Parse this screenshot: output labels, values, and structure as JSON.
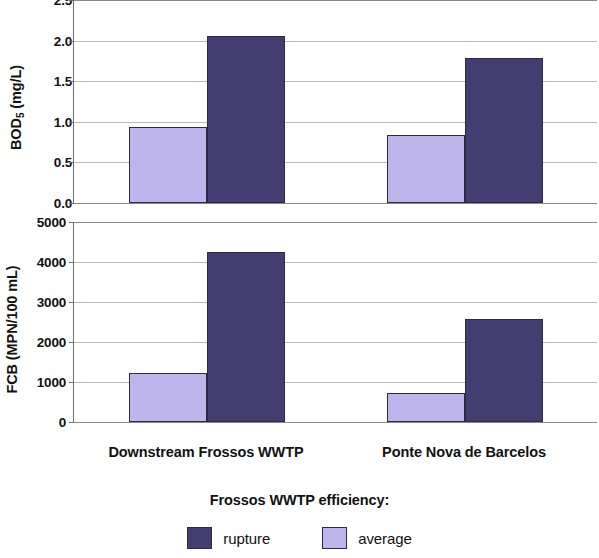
{
  "chart_data": [
    {
      "type": "bar",
      "panel": "top",
      "title": "",
      "xlabel": "",
      "ylabel": "BOD5 (mg/L)",
      "ylabel_base": "BOD",
      "ylabel_sub": "5",
      "ylabel_unit": " (mg/L)",
      "categories": [
        "Downstream Frossos WWTP",
        "Ponte Nova de Barcelos"
      ],
      "series": [
        {
          "name": "average",
          "values": [
            0.94,
            0.84
          ],
          "color": "#bdb5ec"
        },
        {
          "name": "rupture",
          "values": [
            2.06,
            1.78
          ],
          "color": "#443d72"
        }
      ],
      "ylim": [
        0.0,
        2.5
      ],
      "yticks": [
        0.0,
        0.5,
        1.0,
        1.5,
        2.0,
        2.5
      ],
      "ytick_labels": [
        "0.0",
        "0.5",
        "1.0",
        "1.5",
        "2.0",
        "2.5"
      ],
      "grid": true,
      "legend_position": "bottom"
    },
    {
      "type": "bar",
      "panel": "bottom",
      "title": "",
      "xlabel": "",
      "ylabel": "FCB (MPN/100 mL)",
      "categories": [
        "Downstream Frossos WWTP",
        "Ponte Nova de Barcelos"
      ],
      "series": [
        {
          "name": "average",
          "values": [
            1230,
            730
          ],
          "color": "#bdb5ec"
        },
        {
          "name": "rupture",
          "values": [
            4250,
            2580
          ],
          "color": "#443d72"
        }
      ],
      "ylim": [
        0,
        5000
      ],
      "yticks": [
        0,
        1000,
        2000,
        3000,
        4000,
        5000
      ],
      "ytick_labels": [
        "0",
        "1000",
        "2000",
        "3000",
        "4000",
        "5000"
      ],
      "grid": true,
      "legend_position": "bottom"
    }
  ],
  "legend": {
    "title": "Frossos WWTP efficiency:",
    "items": [
      {
        "label": "rupture",
        "color": "#443d72"
      },
      {
        "label": "average",
        "color": "#bdb5ec"
      }
    ]
  },
  "colors": {
    "rupture": "#443d72",
    "average": "#bdb5ec",
    "bar_outline": "#2b2b40",
    "axis": "#6e6e6e",
    "gridline": "#b9b9b9"
  }
}
